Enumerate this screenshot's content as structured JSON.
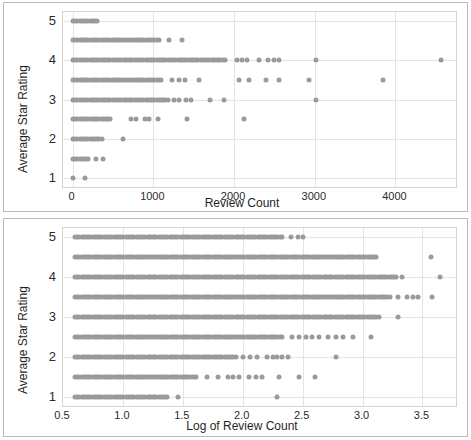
{
  "figure": {
    "width": 471,
    "height": 440,
    "background": "#ffffff",
    "border_color": "#b9b9b9",
    "marker_color": "#9a9a9a",
    "gridline_color": "#e4e4e4",
    "plot_border_color": "#d4d4d4"
  },
  "chart_data": [
    {
      "type": "scatter",
      "title": "",
      "xlabel": "Review Count",
      "ylabel": "Average Star Rating",
      "xlim": [
        -120,
        4750
      ],
      "ylim": [
        0.78,
        5.22
      ],
      "xticks": [
        0,
        1000,
        2000,
        3000,
        4000
      ],
      "xtick_labels": [
        "0",
        "1000",
        "2000",
        "3000",
        "4000"
      ],
      "yticks": [
        1,
        2,
        3,
        4,
        5
      ],
      "ytick_labels": [
        "1",
        "2",
        "3",
        "4",
        "5"
      ],
      "grid": true,
      "legend": "none",
      "rating_levels": [
        1.0,
        1.5,
        2.0,
        2.5,
        3.0,
        3.5,
        4.0,
        4.5,
        5.0
      ],
      "series": [
        {
          "name": "rating-5.0",
          "y": 5.0,
          "x_dense_range": [
            5,
            320
          ],
          "x_sparse": []
        },
        {
          "name": "rating-4.5",
          "y": 4.5,
          "x_dense_range": [
            5,
            1080
          ],
          "x_sparse": [
            1190,
            1350
          ]
        },
        {
          "name": "rating-4.0",
          "y": 4.0,
          "x_dense_range": [
            5,
            1900
          ],
          "x_sparse": [
            2030,
            2100,
            2160,
            2310,
            2420,
            2500,
            2560,
            3020,
            4560
          ]
        },
        {
          "name": "rating-3.5",
          "y": 3.5,
          "x_dense_range": [
            5,
            1120
          ],
          "x_sparse": [
            1230,
            1320,
            1390,
            1560,
            2060,
            2180,
            2400,
            2560,
            2930,
            3840
          ]
        },
        {
          "name": "rating-3.0",
          "y": 3.0,
          "x_dense_range": [
            5,
            1180
          ],
          "x_sparse": [
            1250,
            1320,
            1400,
            1460,
            1700,
            1870,
            3020
          ]
        },
        {
          "name": "rating-2.5",
          "y": 2.5,
          "x_dense_range": [
            5,
            470
          ],
          "x_sparse": [
            720,
            780,
            890,
            950,
            1060,
            1420,
            2120
          ]
        },
        {
          "name": "rating-2.0",
          "y": 2.0,
          "x_dense_range": [
            5,
            360
          ],
          "x_sparse": [
            620
          ]
        },
        {
          "name": "rating-1.5",
          "y": 1.5,
          "x_dense_range": [
            5,
            200
          ],
          "x_sparse": [
            290,
            380
          ]
        },
        {
          "name": "rating-1.0",
          "y": 1.0,
          "x_dense_range": [
            5,
            20
          ],
          "x_sparse": [
            150
          ]
        }
      ]
    },
    {
      "type": "scatter",
      "title": "",
      "xlabel": "Log of Review Count",
      "ylabel": "Average Star Rating",
      "xlim": [
        0.5,
        3.78
      ],
      "ylim": [
        0.78,
        5.22
      ],
      "xticks": [
        0.5,
        1.0,
        1.5,
        2.0,
        2.5,
        3.0,
        3.5
      ],
      "xtick_labels": [
        "0.5",
        "1.0",
        "1.5",
        "2.0",
        "2.5",
        "3.0",
        "3.5"
      ],
      "yticks": [
        1,
        2,
        3,
        4,
        5
      ],
      "ytick_labels": [
        "1",
        "2",
        "3",
        "4",
        "5"
      ],
      "grid": true,
      "legend": "none",
      "rating_levels": [
        1.0,
        1.5,
        2.0,
        2.5,
        3.0,
        3.5,
        4.0,
        4.5,
        5.0
      ],
      "series": [
        {
          "name": "rating-5.0",
          "y": 5.0,
          "x_dense_range": [
            0.6,
            2.34
          ],
          "x_sparse": [
            2.4,
            2.46,
            2.5
          ]
        },
        {
          "name": "rating-4.5",
          "y": 4.5,
          "x_dense_range": [
            0.6,
            3.13
          ],
          "x_sparse": [
            3.57
          ]
        },
        {
          "name": "rating-4.0",
          "y": 4.0,
          "x_dense_range": [
            0.6,
            3.29
          ],
          "x_sparse": [
            3.33,
            3.65
          ]
        },
        {
          "name": "rating-3.5",
          "y": 3.5,
          "x_dense_range": [
            0.6,
            3.24
          ],
          "x_sparse": [
            3.3,
            3.37,
            3.42,
            3.46,
            3.58
          ]
        },
        {
          "name": "rating-3.0",
          "y": 3.0,
          "x_dense_range": [
            0.6,
            3.14
          ],
          "x_sparse": [
            3.3
          ]
        },
        {
          "name": "rating-2.5",
          "y": 2.5,
          "x_dense_range": [
            0.6,
            2.33
          ],
          "x_sparse": [
            2.41,
            2.47,
            2.53,
            2.58,
            2.64,
            2.71,
            2.78,
            2.84,
            2.92,
            3.07
          ]
        },
        {
          "name": "rating-2.0",
          "y": 2.0,
          "x_dense_range": [
            0.6,
            1.95
          ],
          "x_sparse": [
            2.0,
            2.06,
            2.12,
            2.2,
            2.25,
            2.29,
            2.33,
            2.38,
            2.78
          ]
        },
        {
          "name": "rating-1.5",
          "y": 1.5,
          "x_dense_range": [
            0.6,
            1.62
          ],
          "x_sparse": [
            1.7,
            1.79,
            1.88,
            1.92,
            1.97,
            2.05,
            2.11,
            2.16,
            2.3,
            2.47,
            2.6
          ]
        },
        {
          "name": "rating-1.0",
          "y": 1.0,
          "x_dense_range": [
            0.6,
            1.38
          ],
          "x_sparse": [
            1.46,
            2.29
          ]
        }
      ]
    }
  ]
}
